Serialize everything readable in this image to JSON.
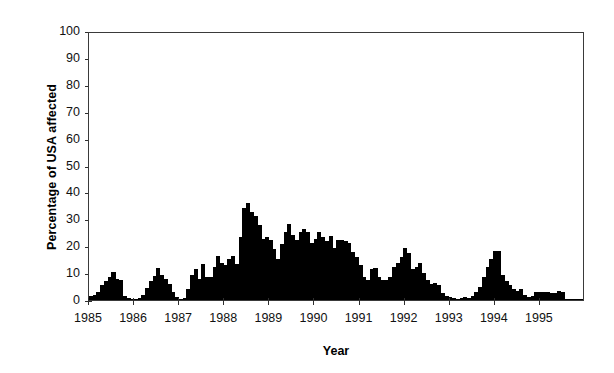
{
  "chart_data": {
    "type": "bar",
    "title": "",
    "xlabel": "Year",
    "ylabel": "Percentage of USA affected",
    "ylim": [
      0,
      100
    ],
    "yticks": [
      0,
      10,
      20,
      30,
      40,
      50,
      60,
      70,
      80,
      90,
      100
    ],
    "ytick_labels": [
      "0",
      "10",
      "20",
      "30",
      "40",
      "50",
      "60",
      "70",
      "80",
      "90",
      "100"
    ],
    "xticks": [
      1985,
      1986,
      1987,
      1988,
      1989,
      1990,
      1991,
      1992,
      1993,
      1994,
      1995
    ],
    "xtick_labels": [
      "1985",
      "1986",
      "1987",
      "1988",
      "1989",
      "1990",
      "1991",
      "1992",
      "1993",
      "1994",
      "1995"
    ],
    "xlim": [
      1985,
      1996
    ],
    "grid": false,
    "legend": null,
    "bar_color": "#000000",
    "frame_color": "#3a3a3a",
    "background": "#ffffff",
    "n_points": 132,
    "x_start": 1985.0,
    "x_step": 0.08333,
    "series": [
      {
        "name": "Percentage of USA affected",
        "values": [
          1.5,
          2.0,
          3.0,
          5.5,
          7.0,
          8.5,
          10.5,
          8.0,
          7.5,
          1.5,
          0.8,
          0.5,
          0.5,
          0.8,
          2.0,
          4.5,
          7.0,
          9.0,
          12.0,
          9.5,
          8.0,
          6.0,
          3.0,
          1.0,
          0.5,
          0.6,
          4.0,
          9.5,
          11.5,
          8.0,
          13.5,
          8.5,
          8.5,
          12.5,
          16.5,
          14.0,
          13.0,
          15.5,
          16.5,
          13.5,
          23.5,
          34.5,
          36.5,
          33.0,
          31.5,
          28.0,
          23.0,
          23.5,
          22.5,
          19.0,
          15.5,
          21.0,
          25.5,
          28.5,
          24.5,
          22.5,
          25.5,
          26.5,
          25.5,
          21.5,
          23.0,
          25.5,
          23.5,
          22.0,
          24.0,
          19.5,
          22.5,
          22.5,
          22.0,
          21.5,
          18.0,
          16.0,
          13.0,
          8.5,
          7.5,
          11.5,
          12.0,
          8.5,
          7.5,
          7.5,
          8.5,
          12.5,
          14.0,
          16.0,
          19.5,
          17.5,
          11.5,
          12.5,
          14.0,
          10.0,
          7.5,
          6.0,
          6.5,
          5.5,
          2.5,
          1.5,
          1.0,
          0.8,
          0.5,
          0.6,
          1.0,
          0.8,
          1.5,
          3.0,
          5.0,
          8.5,
          12.5,
          15.5,
          18.5,
          18.5,
          9.5,
          7.0,
          5.5,
          4.0,
          3.5,
          4.0,
          2.0,
          1.0,
          1.5,
          3.0,
          3.0,
          3.0,
          3.0,
          2.5,
          2.5,
          3.5,
          3.0,
          0.5,
          0.5,
          0.5,
          0.5,
          0.5
        ]
      }
    ]
  }
}
